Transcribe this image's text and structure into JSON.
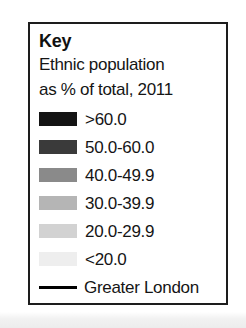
{
  "legend": {
    "title": "Key",
    "subtitle_lines": [
      "Ethnic population",
      "as % of total, 2011"
    ],
    "boundary": {
      "label": "Greater London",
      "symbol": "solid-line",
      "color": "#000000"
    }
  },
  "chart_data": {
    "type": "table",
    "title": "Key",
    "subtitle": "Ethnic population as % of total, 2011",
    "xlabel": "",
    "ylabel": "",
    "legend_position": "standalone",
    "grid": false,
    "categories": [
      ">60.0",
      "50.0-60.0",
      "40.0-49.9",
      "30.0-39.9",
      "20.0-29.9",
      "<20.0"
    ],
    "values": [
      {
        "label": ">60.0",
        "min": 60.0,
        "max": null,
        "color": "#141414"
      },
      {
        "label": "50.0-60.0",
        "min": 50.0,
        "max": 60.0,
        "color": "#3a3a3a"
      },
      {
        "label": "40.0-49.9",
        "min": 40.0,
        "max": 49.9,
        "color": "#8a8a8a"
      },
      {
        "label": "30.0-39.9",
        "min": 30.0,
        "max": 39.9,
        "color": "#b5b5b5"
      },
      {
        "label": "20.0-29.9",
        "min": 20.0,
        "max": 29.9,
        "color": "#d2d2d2"
      },
      {
        "label": "<20.0",
        "min": null,
        "max": 20.0,
        "color": "#eeeeee"
      }
    ],
    "annotations": [
      {
        "label": "Greater London",
        "symbol": "solid-line",
        "color": "#000000"
      }
    ]
  }
}
